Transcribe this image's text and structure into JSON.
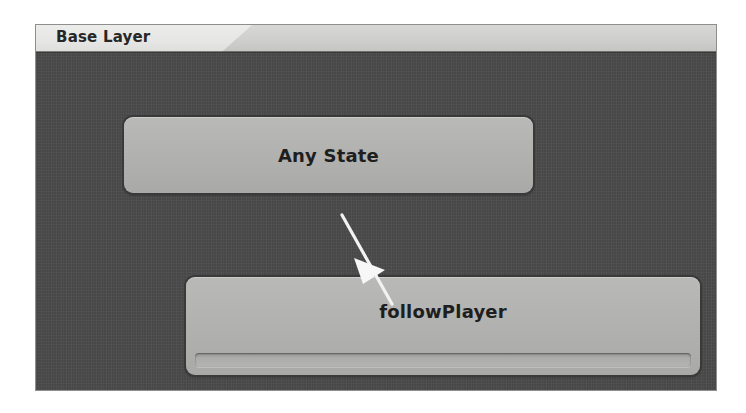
{
  "window": {
    "name": "Animator",
    "background_color": "#4b4b4b",
    "border_color": "#8e8e8e"
  },
  "tab_bar": {
    "active_tab_label": "Base Layer",
    "background_color": "#cfcfcd",
    "tab_color": "#e6e6e4",
    "text_color": "#272727"
  },
  "graph": {
    "background_color": "#4b4b4b",
    "node_fill_color": "#b2b2b0",
    "node_border_color": "#3a3a3a",
    "node_text_color": "#1e1e1e",
    "transition_color": "#f2f2f2",
    "nodes": [
      {
        "id": "any-state",
        "label": "Any State",
        "type": "special-state"
      },
      {
        "id": "follow-player",
        "label": "followPlayer",
        "type": "default-state",
        "progress": 0
      }
    ],
    "transitions": [
      {
        "from": "Any State",
        "to": "followPlayer"
      }
    ]
  }
}
